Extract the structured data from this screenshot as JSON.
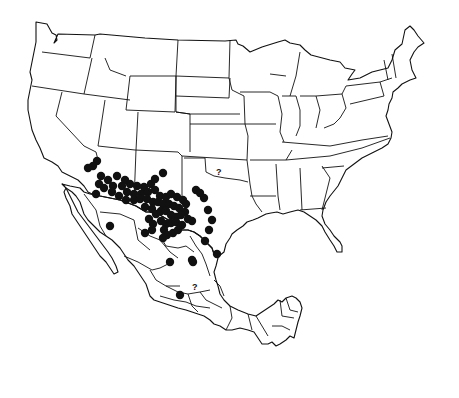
{
  "map": {
    "type": "species distribution map",
    "region": "United States and Mexico",
    "colors": {
      "outline": "#111111",
      "dot": "#111111",
      "background": "#ffffff"
    },
    "uncertain_markers": [
      {
        "label": "?",
        "x": 219,
        "y": 173,
        "location": "Oklahoma"
      },
      {
        "label": "?",
        "x": 195,
        "y": 287,
        "location": "central Mexico"
      }
    ],
    "occurrence_points": [
      [
        97,
        161
      ],
      [
        93,
        166
      ],
      [
        88,
        168
      ],
      [
        101,
        176
      ],
      [
        99,
        184
      ],
      [
        108,
        180
      ],
      [
        117,
        176
      ],
      [
        125,
        180
      ],
      [
        104,
        188
      ],
      [
        113,
        186
      ],
      [
        122,
        186
      ],
      [
        130,
        184
      ],
      [
        137,
        186
      ],
      [
        144,
        187
      ],
      [
        151,
        184
      ],
      [
        155,
        179
      ],
      [
        163,
        173
      ],
      [
        96,
        194
      ],
      [
        112,
        192
      ],
      [
        119,
        196
      ],
      [
        127,
        192
      ],
      [
        134,
        194
      ],
      [
        141,
        194
      ],
      [
        148,
        192
      ],
      [
        155,
        190
      ],
      [
        160,
        196
      ],
      [
        166,
        197
      ],
      [
        171,
        194
      ],
      [
        177,
        197
      ],
      [
        183,
        200
      ],
      [
        126,
        200
      ],
      [
        134,
        200
      ],
      [
        140,
        199
      ],
      [
        147,
        199
      ],
      [
        153,
        202
      ],
      [
        158,
        202
      ],
      [
        163,
        204
      ],
      [
        169,
        204
      ],
      [
        174,
        206
      ],
      [
        179,
        208
      ],
      [
        185,
        212
      ],
      [
        186,
        204
      ],
      [
        145,
        207
      ],
      [
        152,
        209
      ],
      [
        156,
        214
      ],
      [
        161,
        211
      ],
      [
        166,
        211
      ],
      [
        171,
        215
      ],
      [
        176,
        217
      ],
      [
        181,
        215
      ],
      [
        188,
        219
      ],
      [
        192,
        221
      ],
      [
        149,
        219
      ],
      [
        153,
        224
      ],
      [
        161,
        221
      ],
      [
        166,
        224
      ],
      [
        171,
        223
      ],
      [
        176,
        222
      ],
      [
        182,
        225
      ],
      [
        152,
        230
      ],
      [
        164,
        230
      ],
      [
        167,
        235
      ],
      [
        173,
        233
      ],
      [
        178,
        230
      ],
      [
        110,
        226
      ],
      [
        145,
        233
      ],
      [
        163,
        238
      ],
      [
        196,
        190
      ],
      [
        200,
        193
      ],
      [
        204,
        198
      ],
      [
        208,
        210
      ],
      [
        212,
        220
      ],
      [
        209,
        230
      ],
      [
        205,
        241
      ],
      [
        217,
        254
      ],
      [
        170,
        262
      ],
      [
        193,
        262
      ],
      [
        192,
        260
      ],
      [
        180,
        295
      ]
    ]
  }
}
